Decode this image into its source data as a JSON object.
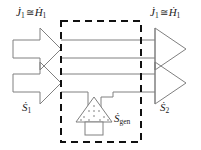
{
  "figure": {
    "type": "thermodynamic-flow-diagram",
    "background_color": "#ffffff",
    "line_color": "#808080",
    "dashed_color": "#111111",
    "text_color": "#1a1a1a"
  },
  "labels": {
    "inlet_energy": {
      "id": "J1-cong-H1-left",
      "symbol_1": "J",
      "symbol_1_sub": "1",
      "operator": "≅",
      "symbol_2": "H",
      "symbol_2_sub": "1",
      "text": "J̇1 ≅ Ḣ1"
    },
    "outlet_energy": {
      "id": "J1-cong-H1-right",
      "symbol_1": "J",
      "symbol_1_sub": "1",
      "operator": "≅",
      "symbol_2": "H",
      "symbol_2_sub": "1",
      "text": "J̇1 ≅ Ḣ1"
    },
    "inlet_entropy": {
      "id": "S1",
      "symbol": "S",
      "sub": "1",
      "text": "Ṡ1"
    },
    "outlet_entropy": {
      "id": "S2",
      "symbol": "S",
      "sub": "2",
      "text": "Ṡ2"
    },
    "entropy_generation": {
      "id": "Sgen",
      "symbol": "S",
      "sub": "gen",
      "text": "Ṡgen"
    }
  },
  "elements": {
    "control_volume": {
      "name": "dashed-control-volume-boundary",
      "style": "dashed",
      "x": 61,
      "y": 21,
      "width": 80,
      "height": 121
    },
    "inlet_arrow_upper": {
      "name": "inlet-arrow-energy",
      "direction": "right"
    },
    "inlet_arrow_lower": {
      "name": "inlet-arrow-entropy",
      "direction": "right"
    },
    "outlet_arrow_upper": {
      "name": "outlet-arrow-energy",
      "direction": "right"
    },
    "outlet_arrow_lower": {
      "name": "outlet-arrow-entropy",
      "direction": "right"
    },
    "generator": {
      "name": "entropy-generation-source",
      "shape": "stippled-triangle-on-pedestal",
      "fill_pattern": "dots"
    }
  }
}
